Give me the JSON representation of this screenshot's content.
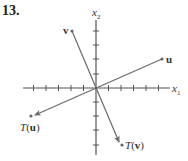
{
  "problem": {
    "number": "13."
  },
  "axes": {
    "x_label": "x",
    "x_sub": "1",
    "y_label": "x",
    "y_sub": "2",
    "x_ticks_neg": 5,
    "x_ticks_pos": 5,
    "y_ticks_pos": 4,
    "y_ticks_neg": 4
  },
  "vectors": [
    {
      "name": "u",
      "label": "u",
      "x": 5,
      "y": 2
    },
    {
      "name": "v",
      "label": "v",
      "x": -2,
      "y": 4
    }
  ],
  "images": [
    {
      "name": "T(u)",
      "label_prefix": "T(",
      "label_vec": "u",
      "label_suffix": ")",
      "x": -5,
      "y": -2
    },
    {
      "name": "T(v)",
      "label_prefix": "T(",
      "label_vec": "v",
      "label_suffix": ")",
      "x": 2,
      "y": -4
    }
  ],
  "colors": {
    "axis": "#555555",
    "vector": "#6a6a6a",
    "text": "#333333"
  }
}
